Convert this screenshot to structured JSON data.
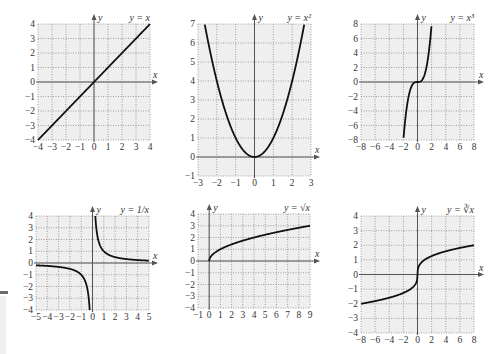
{
  "chart_data": [
    {
      "type": "line",
      "title": "y = x",
      "xlabel": "x",
      "ylabel": "y",
      "xlim": [
        -4,
        4
      ],
      "ylim": [
        -4,
        4
      ],
      "xticks": [
        -4,
        -3,
        -2,
        -1,
        0,
        1,
        2,
        3,
        4
      ],
      "yticks": [
        -4,
        -3,
        -2,
        -1,
        0,
        1,
        2,
        3,
        4
      ],
      "grid": true,
      "x": [
        -4,
        -2,
        0,
        2,
        4
      ],
      "y": [
        -4,
        -2,
        0,
        2,
        4
      ],
      "fn": "x",
      "box": {
        "x0": 38,
        "x1": 150,
        "y0": 24,
        "y1": 140
      },
      "yaxis_top": 14,
      "xaxis_right": 158
    },
    {
      "type": "line",
      "title": "y = x²",
      "xlabel": "x",
      "ylabel": "y",
      "xlim": [
        -3,
        3
      ],
      "ylim": [
        -1,
        7
      ],
      "xticks": [
        -3,
        -2,
        -1,
        0,
        1,
        2,
        3
      ],
      "yticks": [
        -1,
        0,
        1,
        2,
        3,
        4,
        5,
        6,
        7
      ],
      "grid": true,
      "x": [
        -2.65,
        -2,
        -1,
        0,
        1,
        2,
        2.65
      ],
      "y": [
        7,
        4,
        1,
        0,
        1,
        4,
        7
      ],
      "fn": "sq",
      "box": {
        "x0": 198,
        "x1": 311,
        "y0": 24,
        "y1": 176
      },
      "yaxis_top": 14,
      "xaxis_right": 320
    },
    {
      "type": "line",
      "title": "y = x³",
      "xlabel": "x",
      "ylabel": "y",
      "xlim": [
        -8,
        8
      ],
      "ylim": [
        -8,
        8
      ],
      "xticks": [
        -8,
        -6,
        -4,
        -2,
        0,
        2,
        4,
        6,
        8
      ],
      "yticks": [
        -8,
        -6,
        -4,
        -2,
        0,
        2,
        4,
        6,
        8
      ],
      "grid": true,
      "x": [
        -2,
        -1,
        0,
        1,
        2
      ],
      "y": [
        -8,
        -1,
        0,
        1,
        8
      ],
      "fn": "cube",
      "box": {
        "x0": 361,
        "x1": 474,
        "y0": 24,
        "y1": 140
      },
      "yaxis_top": 14,
      "xaxis_right": 484
    },
    {
      "type": "line",
      "title": "y = 1/x",
      "xlabel": "x",
      "ylabel": "y",
      "xlim": [
        -5,
        5
      ],
      "ylim": [
        -4,
        4
      ],
      "xticks": [
        -5,
        -4,
        -3,
        -2,
        -1,
        0,
        1,
        2,
        3,
        4,
        5
      ],
      "yticks": [
        -4,
        -3,
        -2,
        -1,
        0,
        1,
        2,
        3,
        4
      ],
      "grid": true,
      "x": [
        -5,
        -2,
        -1,
        -0.5,
        -0.25,
        0.25,
        0.5,
        1,
        2,
        5
      ],
      "y": [
        -0.2,
        -0.5,
        -1,
        -2,
        -4,
        4,
        2,
        1,
        0.5,
        0.2
      ],
      "fn": "recip",
      "box": {
        "x0": 36,
        "x1": 149,
        "y0": 216,
        "y1": 310
      },
      "yaxis_top": 206,
      "xaxis_right": 158
    },
    {
      "type": "line",
      "title": "y = √x",
      "xlabel": "x",
      "ylabel": "y",
      "xlim": [
        -1,
        9
      ],
      "ylim": [
        -4,
        4
      ],
      "xticks": [
        -1,
        0,
        1,
        2,
        3,
        4,
        5,
        6,
        7,
        8,
        9
      ],
      "yticks": [
        -4,
        -3,
        -2,
        -1,
        0,
        1,
        2,
        3,
        4
      ],
      "grid": true,
      "x": [
        0,
        1,
        4,
        9
      ],
      "y": [
        0,
        1,
        2,
        3
      ],
      "fn": "sqrt",
      "box": {
        "x0": 198,
        "x1": 310,
        "y0": 214,
        "y1": 308
      },
      "yaxis_top": 204,
      "xaxis_right": 320
    },
    {
      "type": "line",
      "title": "y = ∛x",
      "xlabel": "x",
      "ylabel": "y",
      "xlim": [
        -8,
        8
      ],
      "ylim": [
        -4,
        4
      ],
      "xticks": [
        -8,
        -6,
        -4,
        -2,
        0,
        2,
        4,
        6,
        8
      ],
      "yticks": [
        -4,
        -3,
        -2,
        -1,
        0,
        1,
        2,
        3,
        4
      ],
      "grid": true,
      "x": [
        -8,
        -1,
        0,
        1,
        8
      ],
      "y": [
        -2,
        -1,
        0,
        1,
        2
      ],
      "fn": "cbrt",
      "box": {
        "x0": 361,
        "x1": 474,
        "y0": 216,
        "y1": 333
      },
      "yaxis_top": 206,
      "xaxis_right": 484
    }
  ],
  "colors": {
    "plot_bg": "#efefef",
    "grid": "#8a8a8a",
    "axis": "#555555",
    "curve": "#111111",
    "text": "#333333"
  }
}
